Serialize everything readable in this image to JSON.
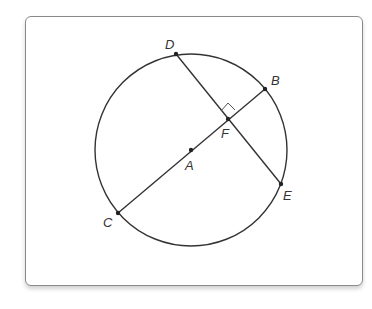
{
  "diagram": {
    "type": "circle-geometry",
    "colors": {
      "stroke": "#333333",
      "frame_border": "#8a8a8a",
      "background": "#ffffff"
    },
    "circle": {
      "center_point": "A",
      "cx": 191,
      "cy": 150,
      "r": 96
    },
    "points": {
      "A": {
        "label": "A",
        "x": 191,
        "y": 150,
        "lx": 185,
        "ly": 170
      },
      "B": {
        "label": "B",
        "x": 265,
        "y": 89,
        "lx": 271,
        "ly": 85
      },
      "C": {
        "label": "C",
        "x": 118,
        "y": 213,
        "lx": 103,
        "ly": 227
      },
      "D": {
        "label": "D",
        "x": 176,
        "y": 54,
        "lx": 165,
        "ly": 49
      },
      "E": {
        "label": "E",
        "x": 281,
        "y": 184,
        "lx": 283,
        "ly": 200
      },
      "F": {
        "label": "F",
        "x": 228,
        "y": 119,
        "lx": 221,
        "ly": 138
      }
    },
    "segments": [
      {
        "name": "diameter-CB",
        "from": "C",
        "to": "B"
      },
      {
        "name": "chord-DE",
        "from": "D",
        "to": "E"
      }
    ],
    "right_angle_marker": {
      "at": "F",
      "between": [
        "FD",
        "FB"
      ],
      "path": "M 221 111 L 228 103 L 235 110"
    }
  }
}
